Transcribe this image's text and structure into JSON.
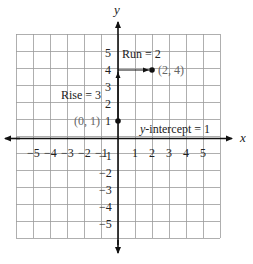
{
  "chart_data": {
    "type": "scatter",
    "title": "",
    "xlabel": "x",
    "ylabel": "y",
    "xlim": [
      -6,
      6
    ],
    "ylim": [
      -6,
      6
    ],
    "grid": true,
    "x_ticks": [
      -5,
      -4,
      -3,
      -2,
      -1,
      1,
      2,
      3,
      4,
      5
    ],
    "y_ticks": [
      5,
      4,
      3,
      2,
      1,
      -1,
      -2,
      -3,
      -4,
      -5
    ],
    "x_tick_labels": [
      "−5",
      "−4",
      "−3",
      "−2",
      "−1",
      "1",
      "2",
      "3",
      "4",
      "5"
    ],
    "y_tick_labels": [
      "5",
      "4",
      "3",
      "2",
      "1",
      "−1",
      "−2",
      "−3",
      "−4",
      "−5"
    ],
    "points": [
      {
        "x": 0,
        "y": 1,
        "label": "(0, 1)"
      },
      {
        "x": 2,
        "y": 4,
        "label": "(2, 4)"
      }
    ],
    "annotations": [
      {
        "text": "Run = 2",
        "from": [
          0,
          4
        ],
        "to": [
          2,
          4
        ],
        "kind": "arrow"
      },
      {
        "text": "Rise = 3",
        "from": [
          0,
          1
        ],
        "to": [
          0,
          4
        ],
        "kind": "arrow"
      },
      {
        "text": "y-intercept = 1",
        "at": [
          0,
          1
        ]
      }
    ]
  },
  "labels": {
    "x_axis": "x",
    "y_axis": "y",
    "run": "Run = 2",
    "rise": "Rise = 3",
    "point_a": "(0, 1)",
    "point_b": "(2, 4)",
    "intercept_italic": "y",
    "intercept_rest": "-intercept = 1"
  },
  "colors": {
    "grid": "#9a9a9a",
    "axis": "#111111",
    "point": "#111111",
    "label_gray": "#666666"
  }
}
